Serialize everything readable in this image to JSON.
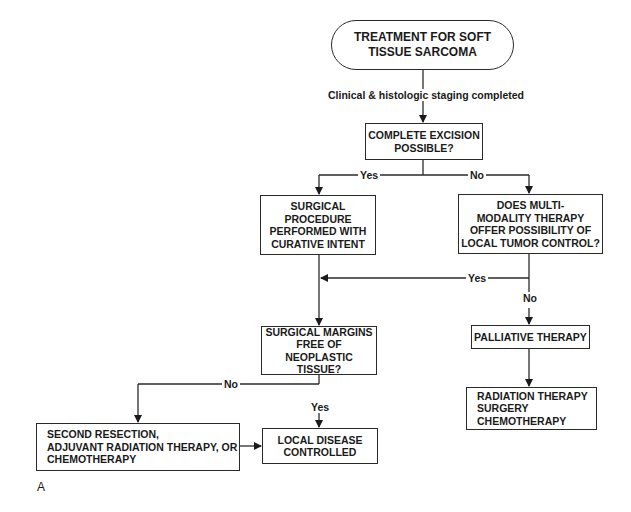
{
  "figure_label": "A",
  "nodes": {
    "start": {
      "lines": [
        "TREATMENT FOR SOFT",
        "TISSUE SARCOMA"
      ]
    },
    "excision": {
      "lines": [
        "COMPLETE EXCISION",
        "POSSIBLE?"
      ]
    },
    "surgical": {
      "lines": [
        "SURGICAL",
        "PROCEDURE",
        "PERFORMED WITH",
        "CURATIVE INTENT"
      ]
    },
    "multimodality": {
      "lines": [
        "DOES MULTI-",
        "MODALITY THERAPY",
        "OFFER POSSIBILITY OF",
        "LOCAL TUMOR CONTROL?"
      ]
    },
    "margins": {
      "lines": [
        "SURGICAL MARGINS",
        "FREE OF",
        "NEOPLASTIC TISSUE?"
      ]
    },
    "palliative": {
      "lines": [
        "PALLIATIVE THERAPY"
      ]
    },
    "palliative_options": {
      "lines": [
        "RADIATION THERAPY",
        "SURGERY",
        "CHEMOTHERAPY"
      ]
    },
    "second_resection": {
      "lines": [
        "SECOND RESECTION,",
        "ADJUVANT RADIATION THERAPY, OR",
        "CHEMOTHERAPY"
      ]
    },
    "controlled": {
      "lines": [
        "LOCAL DISEASE",
        "CONTROLLED"
      ]
    }
  },
  "edge_labels": {
    "staging": "Clinical & histologic staging completed",
    "excision_yes": "Yes",
    "excision_no": "No",
    "multi_yes": "Yes",
    "multi_no": "No",
    "margins_no": "No",
    "margins_yes": "Yes"
  }
}
